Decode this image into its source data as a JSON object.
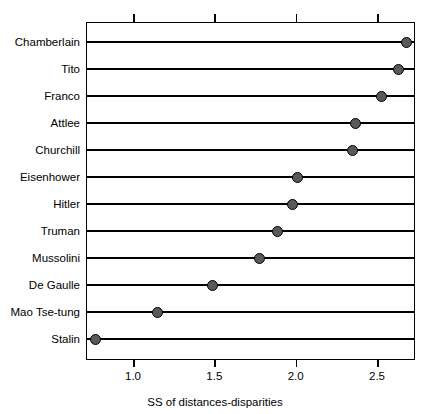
{
  "chart_data": {
    "type": "bar",
    "variant": "cleveland-dot-plot",
    "title": "",
    "xlabel": "SS of distances-disparities",
    "ylabel": "",
    "xlim": [
      0.74,
      2.76
    ],
    "ylim": [],
    "grid": false,
    "legend": null,
    "xticks": [
      1.0,
      1.5,
      2.0,
      2.5
    ],
    "xticklabels": [
      "1.0",
      "1.5",
      "2.0",
      "2.5"
    ],
    "top_axis_ticks": [
      1.0,
      1.5,
      2.0,
      2.5
    ],
    "top_axis_ticklabels": [
      "",
      "",
      "",
      ""
    ],
    "categories": [
      "Chamberlain",
      "Tito",
      "Franco",
      "Attlee",
      "Churchill",
      "Eisenhower",
      "Hitler",
      "Truman",
      "Mussolini",
      "De Gaulle",
      "Mao Tse-tung",
      "Stalin"
    ],
    "values": [
      2.68,
      2.63,
      2.53,
      2.37,
      2.35,
      2.01,
      1.98,
      1.89,
      1.78,
      1.49,
      1.15,
      0.77
    ],
    "series": [
      {
        "name": "SS of distances-disparities",
        "values": [
          2.68,
          2.63,
          2.53,
          2.37,
          2.35,
          2.01,
          1.98,
          1.89,
          1.78,
          1.49,
          1.15,
          0.77
        ]
      }
    ],
    "marker_fill_color": "#595959",
    "marker_edge_color": "#000000",
    "line_color": "#000000",
    "frame_color": "#000000",
    "background_color": "#ffffff"
  }
}
